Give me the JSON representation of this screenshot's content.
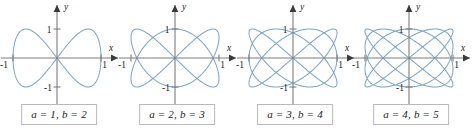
{
  "figure": {
    "background_color": "#ffffff",
    "curve_color": "#7fa6c8",
    "axis_color": "#7c7c7c",
    "caption_border_color": "#b9b9b9"
  },
  "chart_data": {
    "type": "line",
    "title": "",
    "xlabel": "x",
    "ylabel": "y",
    "xlim": [
      -1,
      1
    ],
    "ylim": [
      -1,
      1
    ],
    "x_ticks": [
      -1,
      1
    ],
    "y_ticks": [
      -1,
      1
    ],
    "x_tick_labels": [
      "-1",
      "1"
    ],
    "y_tick_labels": [
      "-1",
      "1"
    ],
    "grid": false,
    "legend": false,
    "panels": [
      {
        "index": 0,
        "caption": "a = 1, b = 2",
        "a": 1,
        "b": 2,
        "equation": "x = sin(1t), y = sin(2t)",
        "x_axis_label": "x",
        "y_axis_label": "y",
        "x_tick_labels": [
          "-1",
          "1"
        ],
        "y_tick_labels": [
          "-1",
          "1"
        ]
      },
      {
        "index": 1,
        "caption": "a = 2, b = 3",
        "a": 2,
        "b": 3,
        "equation": "x = sin(2t), y = sin(3t)",
        "x_axis_label": "x",
        "y_axis_label": "y",
        "x_tick_labels": [
          "-1",
          "1"
        ],
        "y_tick_labels": [
          "-1",
          "1"
        ]
      },
      {
        "index": 2,
        "caption": "a = 3, b = 4",
        "a": 3,
        "b": 4,
        "equation": "x = sin(3t), y = sin(4t)",
        "x_axis_label": "x",
        "y_axis_label": "y",
        "x_tick_labels": [
          "-1",
          "1"
        ],
        "y_tick_labels": [
          "-1",
          "1"
        ]
      },
      {
        "index": 3,
        "caption": "a = 4, b = 5",
        "a": 4,
        "b": 5,
        "equation": "x = sin(4t), y = sin(5t)",
        "x_axis_label": "x",
        "y_axis_label": "y",
        "x_tick_labels": [
          "-1",
          "1"
        ],
        "y_tick_labels": [
          "-1",
          "1"
        ]
      }
    ]
  }
}
